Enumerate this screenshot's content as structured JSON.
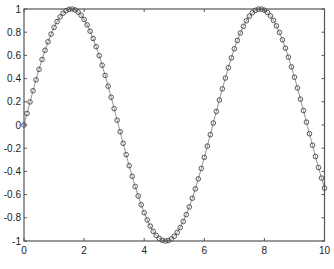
{
  "chart_data": {
    "type": "line",
    "title": "",
    "xlabel": "",
    "ylabel": "",
    "xlim": [
      0,
      10
    ],
    "ylim": [
      -1,
      1
    ],
    "grid": false,
    "legend": null,
    "function": "y = sin(x)",
    "x_start": 0,
    "x_end": 10,
    "x_step": 0.1,
    "marker": "o",
    "line_style": "solid",
    "series": [
      {
        "name": "sin(x)",
        "color": "#555555"
      }
    ],
    "xticks": [
      0,
      2,
      4,
      6,
      8,
      10
    ],
    "xtick_labels": [
      "0",
      "2",
      "4",
      "6",
      "8",
      "10"
    ],
    "yticks": [
      -1,
      -0.8,
      -0.6,
      -0.4,
      -0.2,
      0,
      0.2,
      0.4,
      0.6,
      0.8,
      1
    ],
    "ytick_labels": [
      "-1",
      "-0.8",
      "-0.6",
      "-0.4",
      "-0.2",
      "0",
      "0.2",
      "0.4",
      "0.6",
      "0.8",
      "1"
    ]
  },
  "style": {
    "axis_color": "#555555",
    "line_color": "#777777",
    "marker_color": "#444444"
  }
}
